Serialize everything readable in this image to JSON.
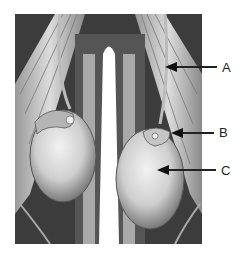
{
  "figure": {
    "labels": [
      {
        "id": "A",
        "text": "A",
        "x": 222,
        "y": 61,
        "arrow_tip_x": 165,
        "arrow_y": 67
      },
      {
        "id": "B",
        "text": "B",
        "x": 219,
        "y": 126,
        "arrow_tip_x": 171,
        "arrow_y": 133
      },
      {
        "id": "C",
        "text": "C",
        "x": 221,
        "y": 164,
        "arrow_tip_x": 157,
        "arrow_y": 170
      }
    ]
  }
}
